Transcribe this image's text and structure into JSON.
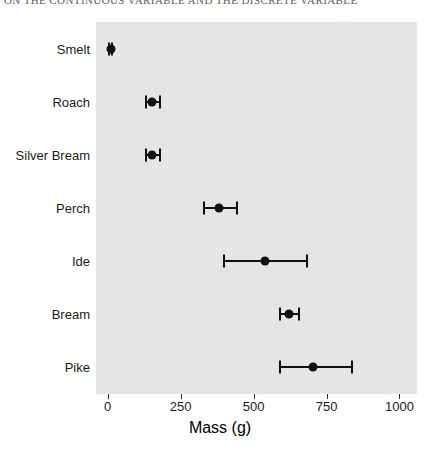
{
  "page_header": {
    "text": "ON THE CONTINUOUS VARIABLE AND THE DISCRETE VARIABLE"
  },
  "chart_data": {
    "type": "scatter",
    "title": "",
    "subtitle": "",
    "xlabel": "Mass (g)",
    "ylabel": "",
    "orientation": "horizontal",
    "grid": false,
    "legend": "none",
    "panel_background": "#e5e5e5",
    "point_color": "#111111",
    "xlim": [
      -40,
      1060
    ],
    "xticks": [
      0,
      250,
      500,
      750,
      1000
    ],
    "xtick_labels": [
      "0",
      "250",
      "500",
      "750",
      "1000"
    ],
    "categories": [
      "Smelt",
      "Roach",
      "Silver Bream",
      "Perch",
      "Ide",
      "Bream",
      "Pike"
    ],
    "series": [
      {
        "name": "Mean mass with interval",
        "points": [
          {
            "category": "Smelt",
            "value": 11,
            "low": 6,
            "high": 16
          },
          {
            "category": "Roach",
            "value": 153,
            "low": 133,
            "high": 180
          },
          {
            "category": "Silver Bream",
            "value": 152,
            "low": 133,
            "high": 178
          },
          {
            "category": "Perch",
            "value": 382,
            "low": 330,
            "high": 442
          },
          {
            "category": "Ide",
            "value": 538,
            "low": 400,
            "high": 683
          },
          {
            "category": "Bream",
            "value": 620,
            "low": 589,
            "high": 655
          },
          {
            "category": "Pike",
            "value": 703,
            "low": 589,
            "high": 838
          }
        ]
      }
    ]
  }
}
